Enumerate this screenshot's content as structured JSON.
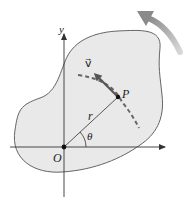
{
  "diagram": {
    "labels": {
      "y_axis": "y",
      "point": "P",
      "radius": "r",
      "angle": "θ",
      "origin": "O",
      "velocity": "v⃗"
    },
    "colors": {
      "body_fill": "#e9e9e9",
      "outline": "#555555",
      "axes": "#333333",
      "dashed_path": "#666666",
      "velocity_arrow": "#555555",
      "rotation_arrow": "#9a9a9a"
    },
    "geometry": {
      "origin": [
        64,
        147
      ],
      "point_p": [
        118,
        97
      ],
      "rotation_direction": "counterclockwise"
    }
  }
}
